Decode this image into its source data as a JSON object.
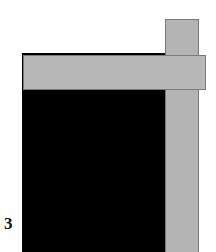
{
  "figure": {
    "panel_label": "3",
    "colors": {
      "background": "#ffffff",
      "block": "#000000",
      "bar_fill": "#b6b6b6",
      "bar_border": "#7a7a7a"
    },
    "shapes": [
      {
        "name": "black-block",
        "type": "rectangle"
      },
      {
        "name": "vertical-bar",
        "type": "rectangle"
      },
      {
        "name": "horizontal-bar",
        "type": "rectangle"
      }
    ]
  }
}
